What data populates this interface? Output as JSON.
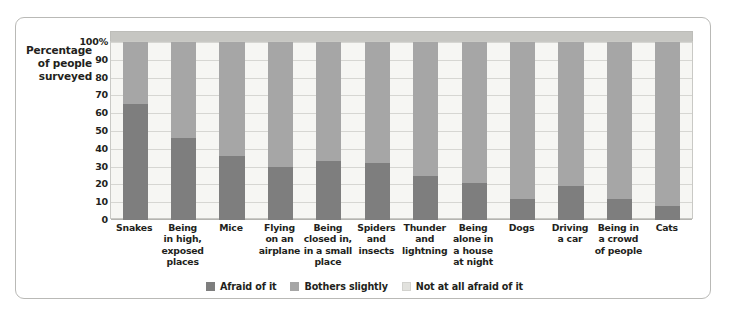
{
  "figure": {
    "caption": ""
  },
  "axis": {
    "y_title_lines": [
      "Percentage",
      "of people",
      "surveyed"
    ],
    "y_ticks": [
      "100%",
      "90",
      "80",
      "70",
      "60",
      "50",
      "40",
      "30",
      "20",
      "10",
      "0"
    ]
  },
  "legend": {
    "items": [
      {
        "label": "Afraid of it",
        "color": "#7e7e7e"
      },
      {
        "label": "Bothers slightly",
        "color": "#a6a6a6"
      },
      {
        "label": "Not at all afraid of it",
        "color": "#e2e2de"
      }
    ]
  },
  "chart_data": {
    "type": "bar",
    "subtype": "stacked-bar-100-percent",
    "title": "",
    "xlabel": "",
    "ylabel": "Percentage of people surveyed",
    "ylim": [
      0,
      100
    ],
    "ytick_values": [
      0,
      10,
      20,
      30,
      40,
      50,
      60,
      70,
      80,
      90,
      100
    ],
    "grid": true,
    "legend_position": "bottom-center",
    "categories": [
      "Snakes",
      "Being in high, exposed places",
      "Mice",
      "Flying on an airplane",
      "Being closed in, in a small place",
      "Spiders and insects",
      "Thunder and lightning",
      "Being alone in a house at night",
      "Dogs",
      "Driving a car",
      "Being in a crowd of people",
      "Cats"
    ],
    "category_label_lines": [
      [
        "Snakes"
      ],
      [
        "Being",
        "in high,",
        "exposed",
        "places"
      ],
      [
        "Mice"
      ],
      [
        "Flying",
        "on an",
        "airplane"
      ],
      [
        "Being",
        "closed in,",
        "in a small",
        "place"
      ],
      [
        "Spiders",
        "and",
        "insects"
      ],
      [
        "Thunder",
        "and",
        "lightning"
      ],
      [
        "Being",
        "alone in",
        "a house",
        "at night"
      ],
      [
        "Dogs"
      ],
      [
        "Driving",
        "a car"
      ],
      [
        "Being in",
        "a crowd",
        "of people"
      ],
      [
        "Cats"
      ]
    ],
    "series": [
      {
        "name": "Afraid of it",
        "color": "#7e7e7e",
        "values": [
          65,
          46,
          36,
          30,
          33,
          32,
          25,
          21,
          12,
          19,
          12,
          8
        ]
      },
      {
        "name": "Bothers slightly",
        "color": "#a6a6a6",
        "values": [
          35,
          54,
          64,
          70,
          67,
          68,
          75,
          79,
          88,
          81,
          88,
          92
        ]
      },
      {
        "name": "Not at all afraid of it",
        "color": "#f6f6f3",
        "values": [
          0,
          0,
          0,
          0,
          0,
          0,
          0,
          0,
          0,
          0,
          0,
          0
        ]
      }
    ]
  }
}
